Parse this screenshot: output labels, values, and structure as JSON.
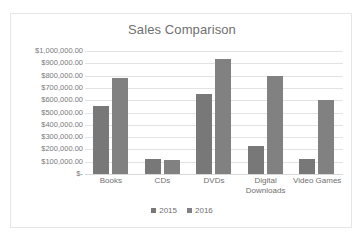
{
  "scan": {
    "top_ghost_text": "........  ....... .........."
  },
  "chart_data": {
    "type": "bar",
    "title": "Sales Comparison",
    "xlabel": "",
    "ylabel": "",
    "categories": [
      "Books",
      "CDs",
      "DVDs",
      "Digital Downloads",
      "Video Games"
    ],
    "series": [
      {
        "name": "2015",
        "values": [
          550000,
          125000,
          650000,
          230000,
          125000
        ],
        "color": "#787878"
      },
      {
        "name": "2016",
        "values": [
          780000,
          110000,
          935000,
          800000,
          600000
        ],
        "color": "#818181"
      }
    ],
    "ylim": [
      0,
      1000000
    ],
    "ytick_labels": [
      "$1,000,000.00",
      "$900,000.00",
      "$800,000.00",
      "$700,000.00",
      "$600,000.00",
      "$500,000.00",
      "$400,000.00",
      "$300,000.00",
      "$200,000.00",
      "$100,000.00",
      "$-"
    ],
    "ytick_values": [
      1000000,
      900000,
      800000,
      700000,
      600000,
      500000,
      400000,
      300000,
      200000,
      100000,
      0
    ],
    "grid": true,
    "legend_position": "bottom"
  }
}
